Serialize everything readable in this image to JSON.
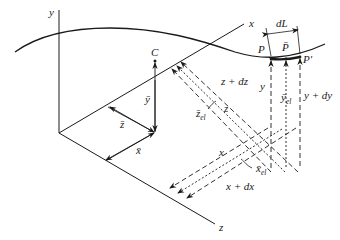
{
  "diagram": {
    "type": "3d-coordinate-geometry",
    "axes": {
      "x": "x",
      "y": "y",
      "z": "z"
    },
    "points": {
      "centroid": "C",
      "p": "P",
      "p_bar": "P̄",
      "p_prime": "P'"
    },
    "labels": {
      "y_bar": "ȳ",
      "z_bar": "z̄",
      "x_bar": "x̄",
      "dL": "dL",
      "z_plus_dz": "z + dz",
      "z": "z",
      "z_el": "z̄",
      "z_el_sub": "el",
      "y": "y",
      "y_el": "ȳ",
      "y_el_sub": "el",
      "y_plus_dy": "y + dy",
      "x": "x",
      "x_el": "x̄",
      "x_el_sub": "el",
      "x_plus_dx": "x + dx"
    },
    "colors": {
      "ink": "#1a1a1a",
      "background": "#ffffff"
    }
  }
}
